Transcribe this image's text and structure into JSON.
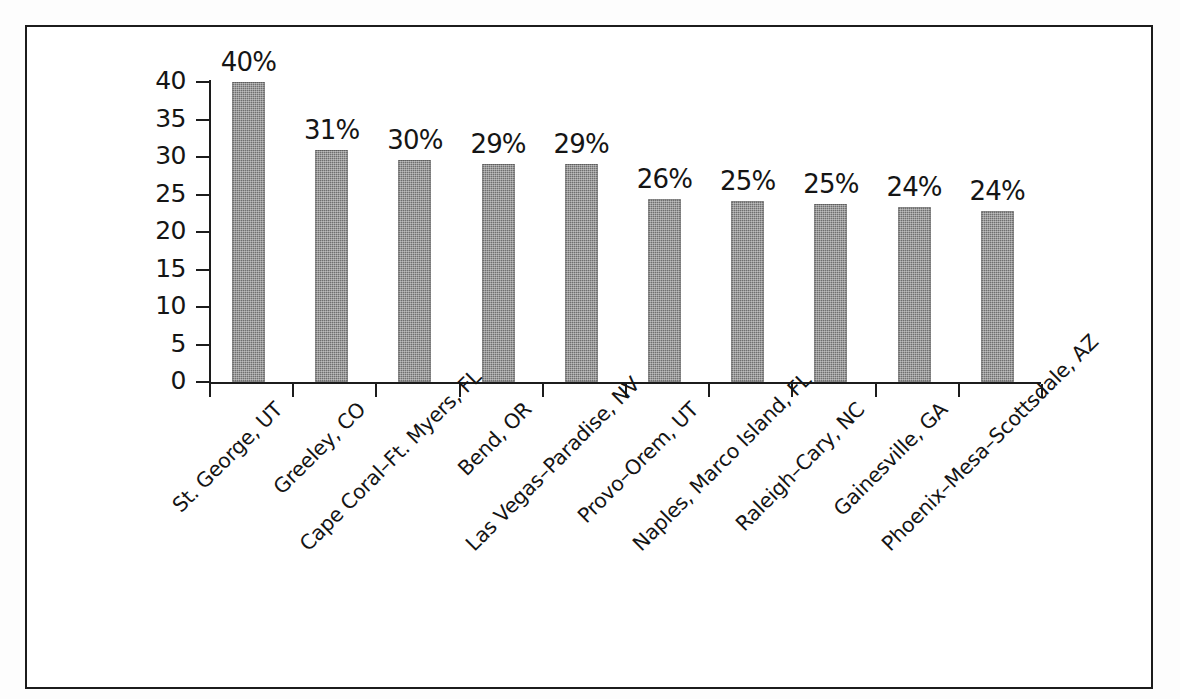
{
  "chart_data": {
    "type": "bar",
    "title": "",
    "subtitle": "",
    "xlabel": "",
    "ylabel": "",
    "ylim": [
      0,
      40
    ],
    "ytick_values": [
      40,
      35,
      30,
      25,
      20,
      15,
      10,
      5,
      0
    ],
    "ytick_labels": [
      "40",
      "35",
      "30",
      "25",
      "20",
      "15",
      "10",
      "5",
      "0"
    ],
    "grid": false,
    "legend": null,
    "legend_position": "none",
    "categories": [
      "St. George, UT",
      "Greeley, CO",
      "Cape Coral–Ft. Myers, FL",
      "Bend, OR",
      "Las Vegas–Paradise, NV",
      "Provo–Orem, UT",
      "Naples, Marco Island, FL",
      "Raleigh–Cary, NC",
      "Gainesville, GA",
      "Phoenix–Mesa–Scottsdale, AZ"
    ],
    "values": [
      40.0,
      31.0,
      29.6,
      29.1,
      29.1,
      24.4,
      24.1,
      23.8,
      23.4,
      22.8
    ],
    "data_labels": [
      "40%",
      "31%",
      "30%",
      "29%",
      "29%",
      "26%",
      "25%",
      "25%",
      "24%",
      "24%"
    ],
    "bar_color": "#6f6f6f",
    "axis_color": "#1c1c1c",
    "background_color": "#ffffff"
  },
  "figure": {
    "border_color": "#1c1c1c"
  }
}
